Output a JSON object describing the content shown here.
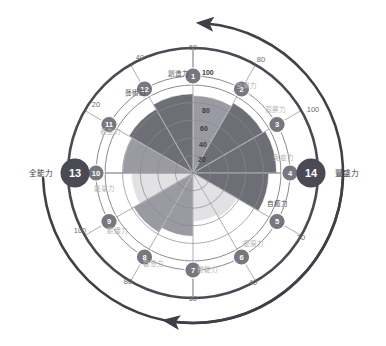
{
  "chart_data": {
    "type": "radar",
    "title": "",
    "center": [
      193,
      173
    ],
    "max_value": 100,
    "inner_tick_labels": [
      "20",
      "40",
      "60",
      "80",
      "100"
    ],
    "grid": true,
    "legend": "none",
    "categories": [
      "全局力",
      "洞察力",
      "免疫力",
      "自癒力",
      "復原力",
      "體能力",
      "智慧力",
      "膽識力",
      "能量力",
      "養生力",
      "藝術力",
      "創造力"
    ],
    "values": [
      88,
      92,
      95,
      86,
      58,
      55,
      72,
      78,
      70,
      80,
      84,
      90
    ],
    "sectors": [
      {
        "index": 1,
        "label": "全局力",
        "value": 88,
        "tone": "mid",
        "label_tone": "light"
      },
      {
        "index": 2,
        "label": "洞察力",
        "value": 92,
        "tone": "dark",
        "label_tone": "light"
      },
      {
        "index": 3,
        "label": "免疫力",
        "value": 95,
        "tone": "dark",
        "label_tone": "light"
      },
      {
        "index": 4,
        "label": "自癒力",
        "value": 86,
        "tone": "dark",
        "label_tone": "dark"
      },
      {
        "index": 5,
        "label": "復原力",
        "value": 58,
        "tone": "pale",
        "label_tone": "light"
      },
      {
        "index": 6,
        "label": "體能力",
        "value": 55,
        "tone": "pale",
        "label_tone": "light"
      },
      {
        "index": 7,
        "label": "智慧力",
        "value": 72,
        "tone": "mid",
        "label_tone": "light"
      },
      {
        "index": 8,
        "label": "膽識力",
        "value": 78,
        "tone": "mid",
        "label_tone": "light"
      },
      {
        "index": 9,
        "label": "能量力",
        "value": 70,
        "tone": "pale",
        "label_tone": "light"
      },
      {
        "index": 10,
        "label": "養生力",
        "value": 80,
        "tone": "mid",
        "label_tone": "light"
      },
      {
        "index": 11,
        "label": "藝術力",
        "value": 84,
        "tone": "dark",
        "label_tone": "dark"
      },
      {
        "index": 12,
        "label": "創造力",
        "value": 90,
        "tone": "dark",
        "label_tone": "dark"
      }
    ],
    "outer_nodes": [
      {
        "index": 13,
        "label": "全能力",
        "side": "left"
      },
      {
        "index": 14,
        "label": "豐盛力",
        "side": "right"
      }
    ],
    "outer_ring_ticks": [
      {
        "text": "60",
        "x": 193,
        "y": 50,
        "anchor": "middle"
      },
      {
        "text": "40",
        "x": 140,
        "y": 60,
        "anchor": "middle"
      },
      {
        "text": "20",
        "x": 96,
        "y": 107,
        "anchor": "middle"
      },
      {
        "text": "100",
        "x": 80,
        "y": 233,
        "anchor": "middle"
      },
      {
        "text": "80",
        "x": 128,
        "y": 284,
        "anchor": "middle"
      },
      {
        "text": "60",
        "x": 193,
        "y": 301,
        "anchor": "middle"
      },
      {
        "text": "40",
        "x": 253,
        "y": 285,
        "anchor": "middle"
      },
      {
        "text": "20",
        "x": 301,
        "y": 240,
        "anchor": "middle"
      },
      {
        "text": "100",
        "x": 313,
        "y": 112,
        "anchor": "middle"
      },
      {
        "text": "80",
        "x": 261,
        "y": 62,
        "anchor": "middle"
      }
    ],
    "inner_ticks": [
      {
        "text": "100",
        "x": 202,
        "y": 75
      },
      {
        "text": "80",
        "x": 202,
        "y": 113
      },
      {
        "text": "60",
        "x": 200,
        "y": 131
      },
      {
        "text": "40",
        "x": 199,
        "y": 147
      },
      {
        "text": "20",
        "x": 198,
        "y": 162
      }
    ],
    "colors": {
      "dark_sector": "#6e6e76",
      "mid_sector": "#9a9aa2",
      "pale_sector": "#e2e2e4",
      "node_fill": "#77777f",
      "big_node_fill": "#4a4a54",
      "ring_stroke": "#4a4a54",
      "grid_stroke": "#8a8a92",
      "arrow": "#3f3f48",
      "background": "#ffffff"
    }
  }
}
